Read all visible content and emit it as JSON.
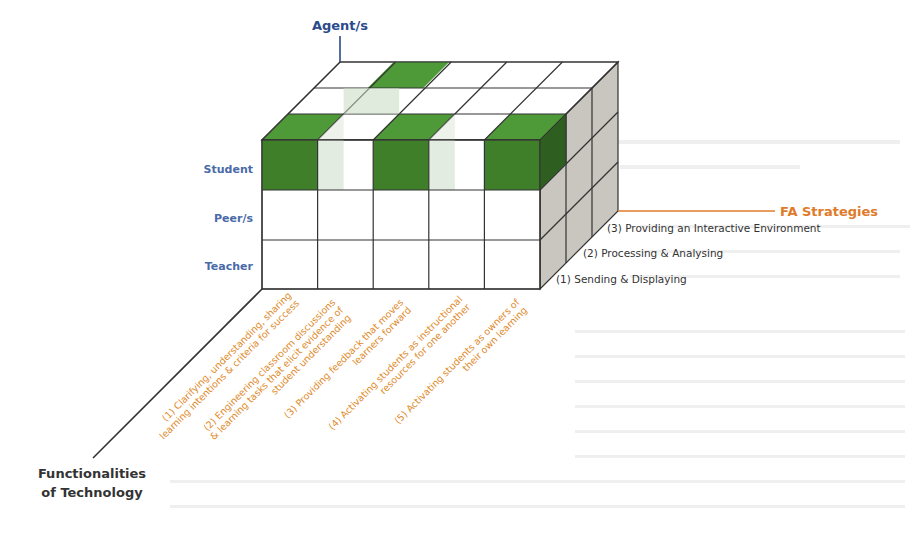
{
  "figure": {
    "colors": {
      "agent_axis_label": "#2b4a8a",
      "row_label": "#4a6aa8",
      "fa_strategies_label": "#e07b2a",
      "fa_line": "#e07b2a",
      "functionality_label": "#e08a2a",
      "axis_title_dark": "#333333",
      "cell_green": "#3f7f2a",
      "cell_green_top": "#4f9a38",
      "cell_green_side": "#2f5f20",
      "cell_green_faint": "#c9dcc2",
      "side_gray": "#c8c6bf",
      "edge": "#333333"
    },
    "axes": {
      "agent": {
        "title": "Agent/s"
      },
      "fa_strategies": {
        "title": "FA Strategies"
      },
      "functionalities": {
        "title_line1": "Functionalities",
        "title_line2": "of Technology"
      }
    },
    "agent_rows": [
      {
        "label": "Student"
      },
      {
        "label": "Peer/s"
      },
      {
        "label": "Teacher"
      }
    ],
    "fa_layers": [
      {
        "label": "(1) Sending & Displaying"
      },
      {
        "label": "(2) Processing & Analysing"
      },
      {
        "label": "(3) Providing an Interactive Environment"
      }
    ],
    "functionalities": [
      {
        "line1": "(1) Clarifying, understanding, sharing",
        "line2": "learning intentions & criteria for success",
        "line3": ""
      },
      {
        "line1": "(2) Engineering classroom discussions",
        "line2": "& learning tasks that elicit evidence of",
        "line3": "student understanding"
      },
      {
        "line1": "(3) Providing feedback that moves",
        "line2": "learners forward",
        "line3": ""
      },
      {
        "line1": "(4) Activating students as instructional",
        "line2": "resources for one another",
        "line3": ""
      },
      {
        "line1": "(5) Activating students as owners of",
        "line2": "their own learning",
        "line3": ""
      }
    ],
    "highlighted_cells": [
      {
        "agent": "Student",
        "functionality": 1,
        "fa_layer": 1
      },
      {
        "agent": "Student",
        "functionality": 3,
        "fa_layer": 1
      },
      {
        "agent": "Student",
        "functionality": 5,
        "fa_layer": 1
      },
      {
        "agent": "Student",
        "functionality": 2,
        "fa_layer": 3
      }
    ]
  }
}
